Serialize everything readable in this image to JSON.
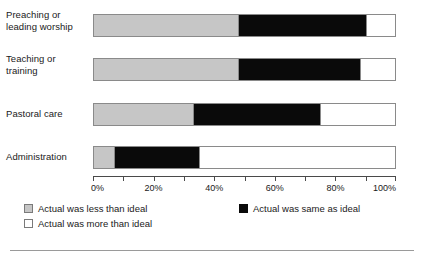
{
  "chart_data": {
    "type": "bar",
    "orientation": "horizontal",
    "stacked": true,
    "stack_total": 100,
    "title": "",
    "subtitle": "",
    "xlabel": "",
    "ylabel": "",
    "xlim": [
      0,
      100
    ],
    "x_tick_values": [
      0,
      10,
      20,
      30,
      40,
      50,
      60,
      70,
      80,
      90,
      100
    ],
    "x_tick_labels": [
      "0%",
      "",
      "20%",
      "",
      "40%",
      "",
      "60%",
      "",
      "80%",
      "",
      "100%"
    ],
    "grid": false,
    "legend_position": "bottom",
    "categories": [
      "Preaching or leading worship",
      "Teaching or training",
      "Pastoral care",
      "Administration"
    ],
    "series": [
      {
        "name": "Actual was less than ideal",
        "color": "#c6c6c6",
        "values": [
          48,
          48,
          33,
          7
        ]
      },
      {
        "name": "Actual was same as ideal",
        "color": "#0a0a0a",
        "values": [
          42,
          40,
          42,
          28
        ]
      },
      {
        "name": "Actual was more than ideal",
        "color": "#ffffff",
        "values": [
          10,
          12,
          25,
          65
        ]
      }
    ],
    "cumulative_boundaries": [
      [
        48,
        90
      ],
      [
        48,
        88
      ],
      [
        33,
        75
      ],
      [
        7,
        35
      ]
    ]
  },
  "categories_display": [
    {
      "line1": "Preaching or",
      "line2": "leading worship",
      "lines": 2
    },
    {
      "line1": "Teaching or",
      "line2": "training",
      "lines": 2
    },
    {
      "line1": "Pastoral care",
      "line2": "",
      "lines": 1
    },
    {
      "line1": "Administration",
      "line2": "",
      "lines": 1
    }
  ],
  "axis": {
    "ticks": [
      {
        "value": 0,
        "label": "0%"
      },
      {
        "value": 10,
        "label": ""
      },
      {
        "value": 20,
        "label": "20%"
      },
      {
        "value": 30,
        "label": ""
      },
      {
        "value": 40,
        "label": "40%"
      },
      {
        "value": 50,
        "label": ""
      },
      {
        "value": 60,
        "label": "60%"
      },
      {
        "value": 70,
        "label": ""
      },
      {
        "value": 80,
        "label": "80%"
      },
      {
        "value": 90,
        "label": ""
      },
      {
        "value": 100,
        "label": "100%"
      }
    ]
  },
  "legend": {
    "less_label": "Actual was less than ideal",
    "same_label": "Actual was same as ideal",
    "more_label": "Actual was more than ideal"
  },
  "colors": {
    "less": "#c6c6c6",
    "same": "#0a0a0a",
    "more": "#ffffff",
    "outline": "#8a8a8a",
    "axis": "#4a4a4a",
    "text": "#1a1a1a"
  }
}
